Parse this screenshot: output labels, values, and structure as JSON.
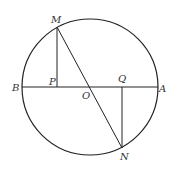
{
  "diagram": {
    "type": "geometry",
    "stroke_color": "#222222",
    "label_color": "#333333",
    "circle": {
      "cx": 90,
      "cy": 87,
      "r": 68
    },
    "points": {
      "M": {
        "x": 57,
        "y": 27,
        "label": "M"
      },
      "N": {
        "x": 122,
        "y": 148,
        "label": "N"
      },
      "A": {
        "x": 158,
        "y": 87,
        "label": "A"
      },
      "B": {
        "x": 22,
        "y": 87,
        "label": "B"
      },
      "O": {
        "x": 90,
        "y": 87,
        "label": "O"
      },
      "P": {
        "x": 57,
        "y": 87,
        "label": "P"
      },
      "Q": {
        "x": 122,
        "y": 87,
        "label": "Q"
      }
    },
    "segments": [
      {
        "from": "B",
        "to": "A"
      },
      {
        "from": "M",
        "to": "N"
      },
      {
        "from": "M",
        "to": "P"
      },
      {
        "from": "Q",
        "to": "N"
      }
    ]
  }
}
